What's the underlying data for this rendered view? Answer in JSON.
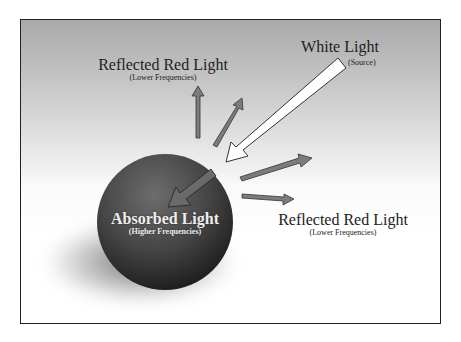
{
  "diagram": {
    "labels": {
      "reflected_top": {
        "title": "Reflected Red Light",
        "subtitle": "(Lower Frequencies)"
      },
      "white_light": {
        "title": "White Light",
        "subtitle": "(Source)"
      },
      "absorbed": {
        "title": "Absorbed Light",
        "subtitle": "(Higher Frequencies)"
      },
      "reflected_right": {
        "title": "Reflected Red Light",
        "subtitle": "(Lower Frequencies)"
      }
    },
    "colors": {
      "frame_border": "#222222",
      "background_top": "#a9a9a9",
      "background_bottom": "#ffffff",
      "sphere_light": "#6a6a6a",
      "sphere_dark": "#1e1e1e",
      "reflected_arrow_fill": "#7a7a7a",
      "white_arrow_fill": "#ffffff"
    },
    "elements": [
      "white light source arrow",
      "sphere",
      "absorbed arrow",
      "4 reflected arrows"
    ]
  }
}
